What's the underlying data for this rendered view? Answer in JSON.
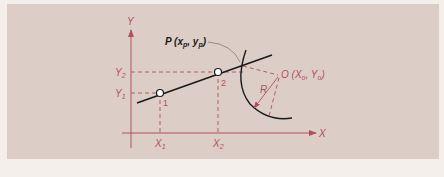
{
  "diagram": {
    "colors": {
      "background": "#f4efea",
      "panel": "#dccec7",
      "axis": "#b0505a",
      "line": "#1a1a1a",
      "dashed": "#b0505a"
    },
    "axes": {
      "x_label": "X",
      "y_label": "Y"
    },
    "ticks": {
      "x1": "X",
      "x1_sub": "1",
      "x2": "X",
      "x2_sub": "2",
      "y1": "Y",
      "y1_sub": "1",
      "y2": "Y",
      "y2_sub": "2"
    },
    "points": [
      {
        "label": "1"
      },
      {
        "label": "2"
      }
    ],
    "intersection_label": {
      "prefix": "P (",
      "x": "x",
      "x_sub": "p",
      "sep": ", ",
      "y": "y",
      "y_sub": "p",
      "suffix": ")"
    },
    "center_label": {
      "prefix": "O (",
      "x": "X",
      "x_sub": "o",
      "sep": ", ",
      "y": "Y",
      "y_sub": "o",
      "suffix": ")"
    },
    "radius_label": "R"
  }
}
